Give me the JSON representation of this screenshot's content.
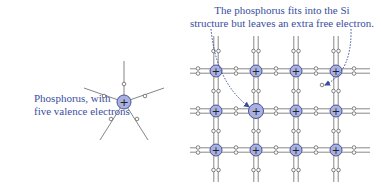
{
  "labels": {
    "phosphorus_line1": "Phosphorus, with",
    "phosphorus_line2": "five valence electrons",
    "annotation_line1": "The phosphorus fits into the Si",
    "annotation_line2": "structure but leaves an extra free electron."
  },
  "atoms": {
    "symbol": "+",
    "fill": "#a9b1e2",
    "stroke": "#4a5493",
    "bond_color": "#888888",
    "arrow_color": "#3a4ea0"
  },
  "lattice": {
    "columns": 4,
    "rows": 3,
    "dopant_position": {
      "row": 1,
      "col": 1
    }
  },
  "phosphorus": {
    "valence_electrons": 5
  }
}
